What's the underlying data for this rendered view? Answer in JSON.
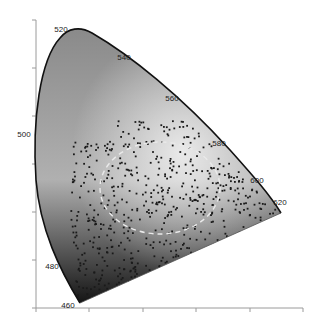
{
  "chart_data": {
    "type": "scatter",
    "title": "",
    "xlabel": "",
    "ylabel": "",
    "x_ticks_px": [
      36,
      89,
      143,
      196,
      250,
      303
    ],
    "y_ticks_px": [
      20,
      68,
      116,
      164,
      212,
      260,
      308
    ],
    "wavelength_labels": [
      {
        "label": "460",
        "x": 68,
        "y": 308
      },
      {
        "label": "480",
        "x": 52,
        "y": 269
      },
      {
        "label": "500",
        "x": 24,
        "y": 137
      },
      {
        "label": "520",
        "x": 61,
        "y": 32
      },
      {
        "label": "540",
        "x": 124,
        "y": 60
      },
      {
        "label": "560",
        "x": 172,
        "y": 101
      },
      {
        "label": "580",
        "x": 219,
        "y": 146
      },
      {
        "label": "600",
        "x": 257,
        "y": 183
      },
      {
        "label": "620",
        "x": 280,
        "y": 205
      }
    ],
    "scatter": {
      "approx_count": 900,
      "center": [
        160,
        190
      ],
      "point_color": "#1a1a1a"
    },
    "ellipse": {
      "cx": 160,
      "cy": 188,
      "rx": 60,
      "ry": 46,
      "style": "dashed",
      "color": "#e8e8e8"
    },
    "colors": {
      "locus": "#111111",
      "axis": "#999999",
      "fill_light": "#d8d8d8",
      "fill_dark": "#222222"
    }
  }
}
